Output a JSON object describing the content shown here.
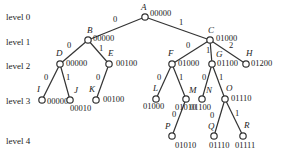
{
  "levels": [
    {
      "label": "level 0",
      "y": 17
    },
    {
      "label": "level 1",
      "y": 42
    },
    {
      "label": "level 2",
      "y": 66
    },
    {
      "label": "level 3",
      "y": 101
    },
    {
      "label": "level 4",
      "y": 141
    }
  ],
  "nodes": [
    {
      "id": "A",
      "x": 145,
      "y": 17,
      "code": "00000",
      "nx": -4,
      "ny": -7,
      "cx": 5,
      "cy": -1
    },
    {
      "id": "B",
      "x": 88,
      "y": 40,
      "code": "00000",
      "nx": -1,
      "ny": -7,
      "cx": 5,
      "cy": 1
    },
    {
      "id": "C",
      "x": 210,
      "y": 40,
      "code": "01000",
      "nx": -2,
      "ny": -7,
      "cx": 6,
      "cy": 1
    },
    {
      "id": "D",
      "x": 60,
      "y": 64,
      "code": "00000",
      "nx": -4,
      "ny": -8,
      "cx": 6,
      "cy": 2
    },
    {
      "id": "E",
      "x": 109,
      "y": 64,
      "code": "00100",
      "nx": -1,
      "ny": -8,
      "cx": 7,
      "cy": 2
    },
    {
      "id": "F",
      "x": 172,
      "y": 64,
      "code": "01000",
      "nx": -4,
      "ny": -8,
      "cx": 6,
      "cy": 2
    },
    {
      "id": "G",
      "x": 212,
      "y": 64,
      "code": "01100",
      "nx": 4,
      "ny": -7,
      "cx": 5,
      "cy": 2
    },
    {
      "id": "H",
      "x": 246,
      "y": 64,
      "code": "01200",
      "nx": 0,
      "ny": -8,
      "cx": 5,
      "cy": 2
    },
    {
      "id": "I",
      "x": 42,
      "y": 100,
      "code": "00000",
      "nx": -5,
      "ny": -8,
      "cx": 5,
      "cy": 4
    },
    {
      "id": "J",
      "x": 70,
      "y": 100,
      "code": "00010",
      "nx": 4,
      "ny": -7,
      "cx": 0,
      "cy": 11
    },
    {
      "id": "K",
      "x": 96,
      "y": 100,
      "code": "00100",
      "nx": -7,
      "ny": -8,
      "cx": 7,
      "cy": 2
    },
    {
      "id": "L",
      "x": 156,
      "y": 99,
      "code": "01000",
      "nx": -3,
      "ny": -8,
      "cx": -13,
      "cy": 10
    },
    {
      "id": "M",
      "x": 186,
      "y": 99,
      "code": "01010",
      "nx": 3,
      "ny": -6,
      "cx": -11,
      "cy": 11
    },
    {
      "id": "N",
      "x": 202,
      "y": 99,
      "code": "01100",
      "nx": 4,
      "ny": -6,
      "cx": -12,
      "cy": 11
    },
    {
      "id": "O",
      "x": 225,
      "y": 99,
      "code": "01110",
      "nx": 1,
      "ny": -8,
      "cx": 6,
      "cy": 2
    },
    {
      "id": "P",
      "x": 172,
      "y": 136,
      "code": "01010",
      "nx": -7,
      "ny": -7,
      "cx": 3,
      "cy": 12
    },
    {
      "id": "Q",
      "x": 214,
      "y": 136,
      "code": "01110",
      "nx": -6,
      "ny": -7,
      "cx": -5,
      "cy": 12
    },
    {
      "id": "R",
      "x": 243,
      "y": 136,
      "code": "01111",
      "nx": 1,
      "ny": -8,
      "cx": -8,
      "cy": 12
    }
  ],
  "edges": [
    {
      "from": "A",
      "to": "B",
      "label": "0",
      "lx": 115,
      "ly": 22
    },
    {
      "from": "A",
      "to": "C",
      "label": "1",
      "lx": 181,
      "ly": 25
    },
    {
      "from": "B",
      "to": "D",
      "label": "0",
      "lx": 69,
      "ly": 48
    },
    {
      "from": "B",
      "to": "E",
      "label": "1",
      "lx": 101,
      "ly": 51
    },
    {
      "from": "C",
      "to": "F",
      "label": "0",
      "lx": 188,
      "ly": 48
    },
    {
      "from": "C",
      "to": "G",
      "label": "1",
      "lx": 208,
      "ly": 53
    },
    {
      "from": "C",
      "to": "H",
      "label": "2",
      "lx": 231,
      "ly": 48
    },
    {
      "from": "D",
      "to": "I",
      "label": "0",
      "lx": 46,
      "ly": 80
    },
    {
      "from": "D",
      "to": "J",
      "label": "1",
      "lx": 68,
      "ly": 80
    },
    {
      "from": "E",
      "to": "K",
      "label": "0",
      "lx": 98,
      "ly": 80
    },
    {
      "from": "F",
      "to": "L",
      "label": "0",
      "lx": 159,
      "ly": 80
    },
    {
      "from": "F",
      "to": "M",
      "label": "1",
      "lx": 181,
      "ly": 80
    },
    {
      "from": "G",
      "to": "N",
      "label": "0",
      "lx": 204,
      "ly": 80
    },
    {
      "from": "G",
      "to": "O",
      "label": "1",
      "lx": 221,
      "ly": 80
    },
    {
      "from": "M",
      "to": "P",
      "label": "0",
      "lx": 174,
      "ly": 117
    },
    {
      "from": "O",
      "to": "Q",
      "label": "0",
      "lx": 212,
      "ly": 118
    },
    {
      "from": "O",
      "to": "R",
      "label": "1",
      "lx": 237,
      "ly": 116
    }
  ]
}
